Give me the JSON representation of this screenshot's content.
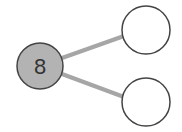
{
  "diagram": {
    "type": "number-bond",
    "whole": {
      "value": "8",
      "fill": "#b3b3b3"
    },
    "parts": [
      {
        "value": "",
        "fill": "#ffffff"
      },
      {
        "value": "",
        "fill": "#ffffff"
      }
    ],
    "colors": {
      "stroke": "#444444",
      "connector": "#a6a6a6"
    }
  }
}
